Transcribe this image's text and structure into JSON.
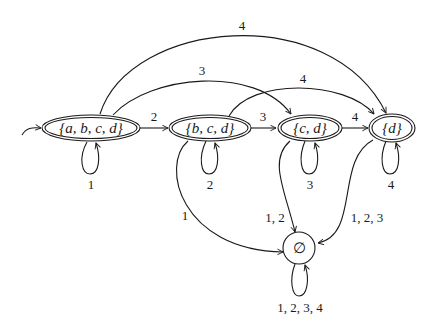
{
  "diagram": {
    "type": "finite-automaton",
    "start_state": "s0",
    "states": [
      {
        "id": "s0",
        "label": "{a, b, c, d}",
        "accepting": true
      },
      {
        "id": "s1",
        "label": "{b, c, d}",
        "accepting": true
      },
      {
        "id": "s2",
        "label": "{c, d}",
        "accepting": true
      },
      {
        "id": "s3",
        "label": "{d}",
        "accepting": true
      },
      {
        "id": "s4",
        "label": "∅",
        "accepting": false
      }
    ],
    "transitions": [
      {
        "id": "t0",
        "from": "s0",
        "to": "s0",
        "label": "1"
      },
      {
        "id": "t1",
        "from": "s0",
        "to": "s1",
        "label": "2"
      },
      {
        "id": "t2",
        "from": "s0",
        "to": "s2",
        "label": "3"
      },
      {
        "id": "t3",
        "from": "s0",
        "to": "s3",
        "label": "4"
      },
      {
        "id": "t4",
        "from": "s1",
        "to": "s1",
        "label": "2"
      },
      {
        "id": "t5",
        "from": "s1",
        "to": "s2",
        "label": "3"
      },
      {
        "id": "t6",
        "from": "s1",
        "to": "s3",
        "label": "4"
      },
      {
        "id": "t7",
        "from": "s1",
        "to": "s4",
        "label": "1"
      },
      {
        "id": "t8",
        "from": "s2",
        "to": "s2",
        "label": "3"
      },
      {
        "id": "t9",
        "from": "s2",
        "to": "s3",
        "label": "4"
      },
      {
        "id": "t10",
        "from": "s2",
        "to": "s4",
        "label": "1, 2"
      },
      {
        "id": "t11",
        "from": "s3",
        "to": "s3",
        "label": "4"
      },
      {
        "id": "t12",
        "from": "s3",
        "to": "s4",
        "label": "1, 2, 3"
      },
      {
        "id": "t13",
        "from": "s4",
        "to": "s4",
        "label": "1, 2, 3, 4"
      }
    ]
  }
}
